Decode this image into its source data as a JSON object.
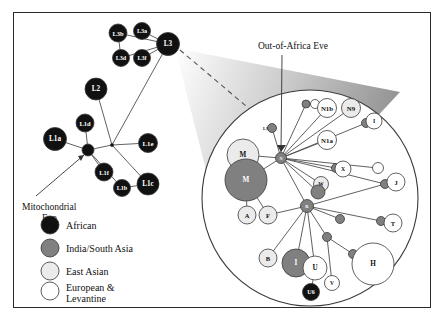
{
  "figure": {
    "title_annotations": {
      "mito_eve": {
        "line1": "Mitochondrial",
        "line2": "Eve"
      },
      "ooa_eve": "Out-of-Africa Eve"
    }
  },
  "colors": {
    "african": "#111111",
    "india_south_asia": "#808080",
    "east_asian": "#ebebeb",
    "european_levantine": "#ffffff",
    "stroke": "#444444",
    "frame": "#2b2b2b",
    "label_on_dark": "#ffffff",
    "label_on_light": "#111111"
  },
  "legend": {
    "items": [
      {
        "label": "African",
        "color_key": "african"
      },
      {
        "label": "India/South Asia",
        "color_key": "india_south_asia"
      },
      {
        "label": "East Asian",
        "color_key": "east_asian"
      },
      {
        "label": "European & Levantine",
        "line1": "European &",
        "line2": "Levantine",
        "color_key": "european_levantine"
      }
    ]
  },
  "chart_data": {
    "type": "diagram",
    "subtype": "phylogenetic-network-with-magnifier",
    "main_network": {
      "nodes": [
        {
          "id": "L3b",
          "label": "L3b",
          "x": 118,
          "y": 33,
          "r": 9.0,
          "group": "african"
        },
        {
          "id": "L3a",
          "label": "L3a",
          "x": 142,
          "y": 31,
          "r": 8.5,
          "group": "african"
        },
        {
          "id": "L3d",
          "label": "L3d",
          "x": 121,
          "y": 58,
          "r": 8.5,
          "group": "african"
        },
        {
          "id": "L3f",
          "label": "L3f",
          "x": 142,
          "y": 58,
          "r": 8.5,
          "group": "african"
        },
        {
          "id": "L3",
          "label": "L3",
          "x": 168,
          "y": 44,
          "r": 11.5,
          "group": "african"
        },
        {
          "id": "L2",
          "label": "L2",
          "x": 96,
          "y": 89,
          "r": 11.0,
          "group": "african"
        },
        {
          "id": "L1d",
          "label": "L1d",
          "x": 85,
          "y": 123,
          "r": 9.0,
          "group": "african"
        },
        {
          "id": "L1a",
          "label": "L1a",
          "x": 55,
          "y": 139,
          "r": 11.5,
          "group": "african"
        },
        {
          "id": "EVE",
          "label": "",
          "x": 88,
          "y": 150,
          "r": 6.0,
          "group": "african"
        },
        {
          "id": "L1e",
          "label": "L1e",
          "x": 148,
          "y": 143,
          "r": 9.5,
          "group": "african"
        },
        {
          "id": "L1f",
          "label": "L1f",
          "x": 104,
          "y": 172,
          "r": 9.0,
          "group": "african"
        },
        {
          "id": "L1b",
          "label": "L1b",
          "x": 122,
          "y": 188,
          "r": 8.5,
          "group": "african"
        },
        {
          "id": "L1c",
          "label": "L1c",
          "x": 148,
          "y": 184,
          "r": 11.0,
          "group": "african"
        },
        {
          "id": "HUB",
          "label": "",
          "x": 112,
          "y": 145,
          "r": 1.6,
          "group": "african"
        }
      ],
      "edges": [
        [
          "L3b",
          "L3"
        ],
        [
          "L3a",
          "L3"
        ],
        [
          "L3d",
          "L3"
        ],
        [
          "L3f",
          "L3"
        ],
        [
          "L3b",
          "L3d"
        ],
        [
          "L3",
          "HUB"
        ],
        [
          "L2",
          "HUB"
        ],
        [
          "HUB",
          "EVE"
        ],
        [
          "HUB",
          "L1e"
        ],
        [
          "EVE",
          "L1a"
        ],
        [
          "EVE",
          "L1d"
        ],
        [
          "EVE",
          "L1f"
        ],
        [
          "EVE",
          "L1b"
        ],
        [
          "HUB",
          "L1c"
        ],
        [
          "L1b",
          "L1c"
        ]
      ]
    },
    "magnifier": {
      "circle": {
        "cx": 310,
        "cy": 198,
        "r": 108
      },
      "cone_apex": {
        "x": 175,
        "y": 48
      },
      "nodes": [
        {
          "id": "L3m",
          "label": "L3",
          "x": 272,
          "y": 128,
          "r": 4.5,
          "group": "india_south_asia",
          "label_pos": "left"
        },
        {
          "id": "N",
          "label": "N",
          "x": 281,
          "y": 158,
          "r": 5.5,
          "group": "india_south_asia"
        },
        {
          "id": "Mlight",
          "label": "M",
          "x": 243,
          "y": 155,
          "r": 16.0,
          "group": "east_asian"
        },
        {
          "id": "Mdark",
          "label": "M",
          "x": 246,
          "y": 180,
          "r": 21.0,
          "group": "india_south_asia"
        },
        {
          "id": "A",
          "label": "A",
          "x": 247,
          "y": 215,
          "r": 9.0,
          "group": "east_asian"
        },
        {
          "id": "F",
          "label": "F",
          "x": 268,
          "y": 215,
          "r": 9.0,
          "group": "east_asian"
        },
        {
          "id": "n1bA",
          "label": "",
          "x": 306,
          "y": 104,
          "r": 4.0,
          "group": "india_south_asia"
        },
        {
          "id": "n1bB",
          "label": "",
          "x": 315,
          "y": 104,
          "r": 4.5,
          "group": "european_levantine"
        },
        {
          "id": "N1b",
          "label": "N1b",
          "x": 327,
          "y": 108,
          "r": 9.5,
          "group": "european_levantine"
        },
        {
          "id": "N9",
          "label": "N9",
          "x": 351,
          "y": 108,
          "r": 9.5,
          "group": "east_asian"
        },
        {
          "id": "Idot",
          "label": "",
          "x": 366,
          "y": 123,
          "r": 4.5,
          "group": "india_south_asia"
        },
        {
          "id": "I",
          "label": "I",
          "x": 374,
          "y": 121,
          "r": 8.0,
          "group": "european_levantine"
        },
        {
          "id": "N1a",
          "label": "N1a",
          "x": 327,
          "y": 140,
          "r": 9.5,
          "group": "european_levantine"
        },
        {
          "id": "Xdot",
          "label": "",
          "x": 336,
          "y": 168,
          "r": 4.5,
          "group": "india_south_asia"
        },
        {
          "id": "X",
          "label": "X",
          "x": 343,
          "y": 169,
          "r": 8.0,
          "group": "european_levantine"
        },
        {
          "id": "Wh",
          "label": "",
          "x": 378,
          "y": 168,
          "r": 5.5,
          "group": "european_levantine"
        },
        {
          "id": "Jdot",
          "label": "",
          "x": 385,
          "y": 184,
          "r": 4.5,
          "group": "india_south_asia"
        },
        {
          "id": "J",
          "label": "J",
          "x": 396,
          "y": 182,
          "r": 9.0,
          "group": "european_levantine"
        },
        {
          "id": "Wg",
          "label": "W",
          "x": 321,
          "y": 184,
          "r": 7.5,
          "group": "east_asian"
        },
        {
          "id": "Wd",
          "label": "",
          "x": 318,
          "y": 192,
          "r": 7.0,
          "group": "india_south_asia"
        },
        {
          "id": "R",
          "label": "R",
          "x": 307,
          "y": 206,
          "r": 6.5,
          "group": "india_south_asia"
        },
        {
          "id": "rdot1",
          "label": "",
          "x": 340,
          "y": 219,
          "r": 4.5,
          "group": "india_south_asia"
        },
        {
          "id": "Tdot",
          "label": "",
          "x": 381,
          "y": 221,
          "r": 4.5,
          "group": "india_south_asia"
        },
        {
          "id": "T",
          "label": "T",
          "x": 393,
          "y": 223,
          "r": 9.0,
          "group": "european_levantine"
        },
        {
          "id": "B",
          "label": "B",
          "x": 268,
          "y": 258,
          "r": 9.0,
          "group": "east_asian"
        },
        {
          "id": "Ibig",
          "label": "I",
          "x": 296,
          "y": 263,
          "r": 14.0,
          "group": "india_south_asia"
        },
        {
          "id": "U",
          "label": "U",
          "x": 315,
          "y": 268,
          "r": 12.0,
          "group": "european_levantine"
        },
        {
          "id": "udot",
          "label": "",
          "x": 327,
          "y": 237,
          "r": 4.5,
          "group": "india_south_asia"
        },
        {
          "id": "V",
          "label": "V",
          "x": 332,
          "y": 283,
          "r": 7.5,
          "group": "european_levantine"
        },
        {
          "id": "hdot",
          "label": "",
          "x": 353,
          "y": 254,
          "r": 4.5,
          "group": "india_south_asia"
        },
        {
          "id": "H",
          "label": "H",
          "x": 373,
          "y": 264,
          "r": 21.0,
          "group": "european_levantine"
        },
        {
          "id": "U6",
          "label": "U6",
          "x": 311,
          "y": 292,
          "r": 8.5,
          "group": "african"
        }
      ],
      "edges": [
        [
          "L3m",
          "N"
        ],
        [
          "N",
          "Mlight"
        ],
        [
          "N",
          "Mdark"
        ],
        [
          "Mdark",
          "A"
        ],
        [
          "Mdark",
          "F"
        ],
        [
          "N",
          "n1bA"
        ],
        [
          "n1bA",
          "n1bB"
        ],
        [
          "n1bB",
          "N1b"
        ],
        [
          "N",
          "N9"
        ],
        [
          "N",
          "N1b"
        ],
        [
          "N",
          "N1a"
        ],
        [
          "N",
          "Idot"
        ],
        [
          "Idot",
          "I"
        ],
        [
          "N",
          "Xdot"
        ],
        [
          "Xdot",
          "X"
        ],
        [
          "N",
          "Wh"
        ],
        [
          "N",
          "Jdot"
        ],
        [
          "Jdot",
          "J"
        ],
        [
          "N",
          "Wg"
        ],
        [
          "N",
          "Wd"
        ],
        [
          "N",
          "R"
        ],
        [
          "R",
          "rdot1"
        ],
        [
          "R",
          "Tdot"
        ],
        [
          "Tdot",
          "T"
        ],
        [
          "R",
          "Jdot"
        ],
        [
          "R",
          "F"
        ],
        [
          "R",
          "B"
        ],
        [
          "R",
          "Ibig"
        ],
        [
          "R",
          "U"
        ],
        [
          "R",
          "udot"
        ],
        [
          "udot",
          "V"
        ],
        [
          "udot",
          "hdot"
        ],
        [
          "hdot",
          "H"
        ],
        [
          "U",
          "U6"
        ]
      ]
    }
  }
}
